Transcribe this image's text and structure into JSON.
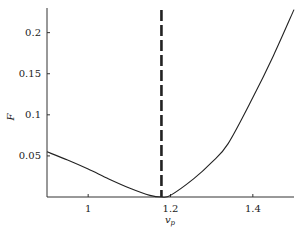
{
  "chart_data": {
    "type": "line",
    "title": "",
    "xlabel": "v_p",
    "ylabel": "F",
    "xlim": [
      0.9,
      1.5
    ],
    "ylim": [
      0,
      0.23
    ],
    "grid": false,
    "legend": null,
    "x_ticks": [
      1,
      1.2,
      1.4
    ],
    "x_tick_labels": [
      "1",
      "1.2",
      "1.4"
    ],
    "y_ticks": [
      0.05,
      0.1,
      0.15,
      0.2
    ],
    "y_tick_labels": [
      "0.05",
      "0.1",
      "0.15",
      "0.2"
    ],
    "series": [
      {
        "name": "F",
        "style": "solid",
        "color": "#222222",
        "x": [
          0.9,
          0.95,
          1.0,
          1.05,
          1.1,
          1.15,
          1.178,
          1.2,
          1.256,
          1.3,
          1.34,
          1.4,
          1.45,
          1.5
        ],
        "y": [
          0.055,
          0.045,
          0.034,
          0.022,
          0.011,
          0.002,
          0.0,
          0.002,
          0.022,
          0.042,
          0.065,
          0.121,
          0.172,
          0.228
        ]
      }
    ],
    "annotations": [
      {
        "type": "vline",
        "x": 1.178,
        "style": "dashed",
        "color": "#222222"
      }
    ]
  }
}
